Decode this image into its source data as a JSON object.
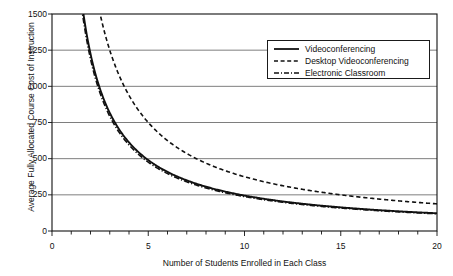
{
  "chart_data": {
    "type": "line",
    "title": "",
    "xlabel": "Number of Students Enrolled in Each Class",
    "ylabel": "Average Fully Allocated Course Cost of Instruction",
    "xlim": [
      0,
      20
    ],
    "ylim": [
      0,
      1500
    ],
    "xticks": [
      0,
      5,
      10,
      15,
      20
    ],
    "xtick_labels": [
      "0",
      "5",
      "10",
      "15",
      "20"
    ],
    "xminor_tick_step": 1,
    "yticks": [
      0,
      250,
      500,
      750,
      1000,
      1250,
      1500
    ],
    "ytick_labels": [
      "0",
      "250",
      "500",
      "750",
      "1000",
      "1250",
      "1500"
    ],
    "grid": "horizontal",
    "legend_position": "top-right",
    "x": [
      1,
      1.5,
      2,
      2.5,
      3,
      3.5,
      4,
      4.5,
      5,
      6,
      7,
      8,
      9,
      10,
      11,
      12,
      13,
      14,
      15,
      16,
      17,
      18,
      19,
      20
    ],
    "series": [
      {
        "name": "Videoconferencing",
        "style": "solid",
        "color": "#111111",
        "values": [
          2450,
          1633,
          1225,
          980,
          817,
          700,
          613,
          544,
          490,
          408,
          350,
          306,
          272,
          245,
          223,
          204,
          188,
          175,
          163,
          153,
          144,
          136,
          129,
          123
        ]
      },
      {
        "name": "Desktop  Videoconferencing",
        "style": "dashed",
        "color": "#111111",
        "values": [
          3750,
          2500,
          1875,
          1500,
          1250,
          1071,
          938,
          833,
          750,
          625,
          536,
          469,
          417,
          375,
          341,
          313,
          288,
          268,
          250,
          234,
          221,
          208,
          197,
          188
        ]
      },
      {
        "name": "Electronic Classroom",
        "style": "dash-dot",
        "color": "#111111",
        "values": [
          2380,
          1587,
          1190,
          952,
          793,
          680,
          595,
          529,
          476,
          397,
          340,
          298,
          264,
          238,
          216,
          198,
          183,
          170,
          159,
          149,
          140,
          132,
          125,
          119
        ]
      }
    ]
  },
  "legend": {
    "items": [
      {
        "label": "Videoconferencing"
      },
      {
        "label": "Desktop  Videoconferencing"
      },
      {
        "label": "Electronic Classroom"
      }
    ]
  }
}
